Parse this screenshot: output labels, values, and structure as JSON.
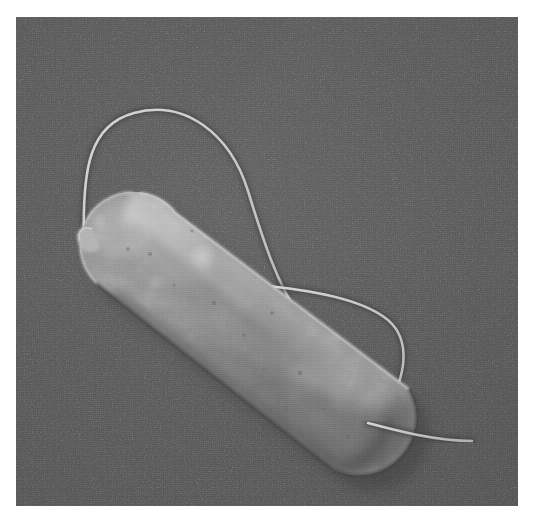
{
  "image": {
    "kind": "scanning-electron-micrograph",
    "subject": "rod-shaped bacterium (bacillus) with flagella",
    "alt_text": "Grayscale scanning electron micrograph of a single rod-shaped bacterial cell oriented diagonally from upper left to lower right on a flat gray substrate, with two long thin flagella: one arcing above the upper-left pole and one sweeping from the mid-right of the cell down past the lower-right pole.",
    "frame": {
      "x": 16,
      "y": 17,
      "width": 502,
      "height": 489,
      "page_background_hex": "#ffffff"
    },
    "palette": {
      "page_background": "#ffffff",
      "substrate_background": "#5d5d5d",
      "substrate_background_light": "#676767",
      "substrate_background_dark": "#545454",
      "cell_body_base": "#9a9a9a",
      "cell_body_highlight": "#c3c3c3",
      "cell_body_midtone": "#8d8d8d",
      "cell_body_shadow": "#6a6a6a",
      "cell_rim_light": "#d2d2d2",
      "drop_shadow": "#3f3f3f",
      "flagellum_highlight": "#cfcfcf",
      "flagellum_shadow": "#3e3e3e"
    },
    "cell": {
      "name": "bacterial-cell-body",
      "shape": "rod / capsule",
      "orientation_degrees": 47,
      "pole_upper_left": {
        "cx": 117,
        "cy": 228,
        "r": 53
      },
      "pole_lower_right": {
        "cx": 355,
        "cy": 412,
        "r": 58
      },
      "surface_texture": "granular, pitted, with mottled brighter and darker patches"
    },
    "flagella": [
      {
        "name": "flagellum-upper-arc",
        "description": "long thin filament emerging near the upper-left pole, rising into a tall arc over the top of the cell and curving back down to the right along the cell's upper flank",
        "path": "M 68 224 C 66 150, 74 108, 118 96 C 168 82, 214 116, 232 174 C 248 226, 262 268, 282 296"
      },
      {
        "name": "flagellum-lower-sweep",
        "description": "filament running along the upper-right side of the cell, bending right into a broad hook and descending toward the lower-right pole",
        "path": "M 240 268 C 288 272, 340 280, 368 300 C 394 318, 392 352, 374 386 C 362 408, 352 420, 344 428"
      },
      {
        "name": "flagellum-trailing-tip",
        "description": "short filament segment trailing from the lower-right pole out to the right edge region",
        "path": "M 352 406 C 382 414, 420 424, 456 424"
      }
    ],
    "labels": {
      "scale_bar": "",
      "caption": "",
      "annotations": []
    }
  }
}
